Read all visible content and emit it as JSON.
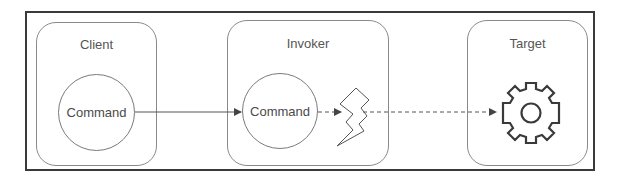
{
  "diagram": {
    "type": "command-pattern",
    "nodes": {
      "client": {
        "title": "Client",
        "inner": "Command"
      },
      "invoker": {
        "title": "Invoker",
        "inner": "Command"
      },
      "target": {
        "title": "Target",
        "icon": "gear-icon"
      }
    },
    "edges": [
      {
        "from": "client.command",
        "to": "invoker.command",
        "style": "solid",
        "arrow": true
      },
      {
        "from": "invoker.command",
        "to": "invoker.lightning",
        "style": "dashed",
        "arrow": true
      },
      {
        "from": "invoker.lightning",
        "to": "target.gear",
        "style": "dashed",
        "arrow": true
      }
    ],
    "icons": {
      "invoker_trigger": "lightning-bolt-icon",
      "target": "gear-icon"
    },
    "colors": {
      "frame": "#3a3a3a",
      "box_border": "#8a8a8a",
      "text": "#555555",
      "line": "#555555"
    }
  }
}
